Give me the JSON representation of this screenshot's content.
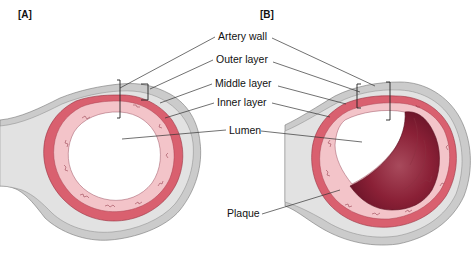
{
  "panels": [
    {
      "id": "A",
      "label": "[A]",
      "description": "Healthy artery cross-section"
    },
    {
      "id": "B",
      "label": "[B]",
      "description": "Artery narrowed by plaque"
    }
  ],
  "labels": {
    "artery_wall": "Artery wall",
    "outer_layer": "Outer layer",
    "middle_layer": "Middle layer",
    "inner_layer": "Inner layer",
    "lumen": "Lumen",
    "plaque": "Plaque"
  },
  "colors": {
    "outer_layer": "#c9c9c9",
    "outer_layer_light": "#e4e4e4",
    "middle_layer": "#d8606e",
    "inner_layer": "#f2c3c8",
    "lumen": "#ffffff",
    "plaque": "#8c2035"
  }
}
